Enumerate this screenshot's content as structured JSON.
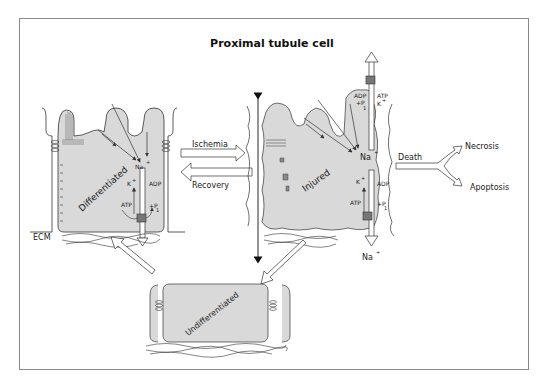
{
  "title": "Proximal tubule cell",
  "cells": {
    "differentiated": {
      "label": "Differentiated",
      "ions": {
        "na": "Na",
        "na_sup": "+",
        "k": "K",
        "k_sup": "+",
        "adp": "ADP",
        "atp": "ATP",
        "pi": "+P",
        "pi_sub": "1"
      },
      "ecm_label": "ECM"
    },
    "injured": {
      "label": "Injured",
      "ions": {
        "na": "Na",
        "na_sup": "+",
        "k": "K",
        "k_sup": "+",
        "adp": "ADP",
        "atp": "ATP",
        "pi": "+P",
        "pi_sub": "1",
        "top_adp": "ADP",
        "top_atp": "ATP",
        "top_pi": "+P",
        "top_pi_sub": "1",
        "top_k": "K",
        "top_k_sup": "+",
        "out_na": "Na",
        "out_na_sup": "+"
      }
    },
    "undifferentiated": {
      "label": "Undifferentiated"
    }
  },
  "transitions": {
    "ischemia": "Ischemia",
    "recovery": "Recovery",
    "death": "Death",
    "necrosis": "Necrosis",
    "apoptosis": "Apoptosis"
  },
  "colors": {
    "cell_fill": "#d9d9d9",
    "stroke": "#333333",
    "frame": "#8a8a8a",
    "pump": "#777777"
  }
}
